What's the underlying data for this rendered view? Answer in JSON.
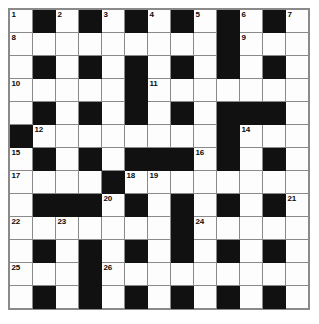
{
  "puzzle": {
    "title": "Crossword Grid",
    "rows": 13,
    "columns": 13,
    "cell_size_px": 23,
    "colors": {
      "block": "#111111",
      "white_cell": "#fdfdfd",
      "grid_line": "#8a8a8a",
      "number_text": "#0a0a0a",
      "page_background": "#ffffff"
    },
    "legend": {
      "block_symbol": "#",
      "white_symbol": "."
    },
    "grid": [
      ".#.#.#.#.#.#.",
      ".........#...",
      ".#.#.#.#.#.#.",
      ".....#.......",
      ".#.#.#.#.###.",
      "#........#...",
      ".#.#.###.#.#.",
      "....#........",
      ".###.#.#.#.#.",
      ".......#.....",
      ".#.#.#.#.#.#.",
      "...#.........",
      ".#.#.#.#.#.#."
    ],
    "numbers": [
      {
        "number": 1,
        "row": 0,
        "col": 0
      },
      {
        "number": 2,
        "row": 0,
        "col": 2
      },
      {
        "number": 3,
        "row": 0,
        "col": 4
      },
      {
        "number": 4,
        "row": 0,
        "col": 6
      },
      {
        "number": 5,
        "row": 0,
        "col": 8
      },
      {
        "number": 6,
        "row": 0,
        "col": 10
      },
      {
        "number": 7,
        "row": 0,
        "col": 12
      },
      {
        "number": 8,
        "row": 1,
        "col": 0
      },
      {
        "number": 9,
        "row": 1,
        "col": 10
      },
      {
        "number": 10,
        "row": 3,
        "col": 0
      },
      {
        "number": 11,
        "row": 3,
        "col": 6
      },
      {
        "number": 12,
        "row": 5,
        "col": 1
      },
      {
        "number": 13,
        "row": 5,
        "col": 9
      },
      {
        "number": 14,
        "row": 5,
        "col": 10
      },
      {
        "number": 15,
        "row": 6,
        "col": 0
      },
      {
        "number": 16,
        "row": 6,
        "col": 8
      },
      {
        "number": 17,
        "row": 7,
        "col": 0
      },
      {
        "number": 18,
        "row": 7,
        "col": 5
      },
      {
        "number": 19,
        "row": 7,
        "col": 6
      },
      {
        "number": 20,
        "row": 8,
        "col": 4
      },
      {
        "number": 21,
        "row": 8,
        "col": 12
      },
      {
        "number": 22,
        "row": 9,
        "col": 0
      },
      {
        "number": 23,
        "row": 9,
        "col": 2
      },
      {
        "number": 24,
        "row": 9,
        "col": 8
      },
      {
        "number": 25,
        "row": 11,
        "col": 0
      },
      {
        "number": 26,
        "row": 11,
        "col": 4
      }
    ]
  }
}
